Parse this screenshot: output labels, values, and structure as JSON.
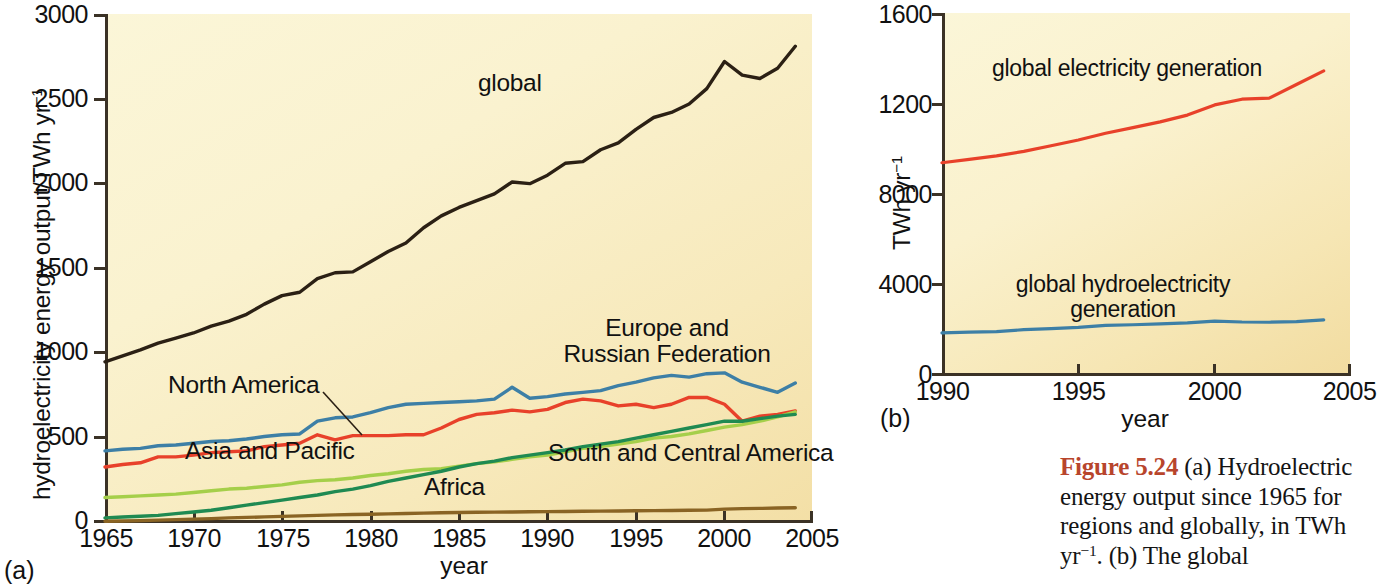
{
  "figure": {
    "number": "5.24",
    "number_prefix": "Figure",
    "caption_text": " (a)  Hydroelectric energy output since 1965 for regions and globally, in TWh yr",
    "caption_sup": "−1",
    "caption_tail": ". (b)  The global",
    "accent_color": "#b8452c"
  },
  "panel_a": {
    "tag": "(a)",
    "ylabel_main": "hydroelectricity energy output/TWh yr",
    "ylabel_sup": "−1",
    "xlabel": "year",
    "yticks": [
      "0",
      "500",
      "1000",
      "1500",
      "2000",
      "2500",
      "3000"
    ],
    "xticks": [
      "1965",
      "1970",
      "1975",
      "1980",
      "1985",
      "1990",
      "1995",
      "2000",
      "2005"
    ],
    "labels": {
      "global": "global",
      "north_america": "North America",
      "europe_russia_line1": "Europe and",
      "europe_russia_line2": "Russian Federation",
      "asia_pacific": "Asia and Pacific",
      "south_central_america": "South and Central America",
      "africa": "Africa"
    },
    "colors": {
      "global": "#2b2014",
      "europe_russia": "#3d7fa6",
      "north_america": "#e8412a",
      "asia_pacific": "#a5cf4a",
      "south_central_america": "#1f8a52",
      "africa": "#8a6424",
      "plot_background": "#f9efc7",
      "axis": "#3b3226"
    }
  },
  "panel_b": {
    "tag": "(b)",
    "ylabel_main": "TWh yr",
    "ylabel_sup": "−1",
    "xlabel": "year",
    "yticks": [
      "0",
      "4000",
      "8000",
      "1200",
      "1600"
    ],
    "xticks": [
      "1990",
      "1995",
      "2000",
      "2005"
    ],
    "labels": {
      "electricity": "global electricity generation",
      "hydro_line1": "global hydroelectricity",
      "hydro_line2": "generation"
    },
    "colors": {
      "electricity": "#e8412a",
      "hydro": "#3d7fa6",
      "plot_background": "#f9efc7",
      "axis": "#3b3226"
    }
  },
  "chart_data": [
    {
      "type": "line",
      "id": "panel_a",
      "title": "Hydroelectric energy output since 1965 for regions and globally",
      "xlabel": "year",
      "ylabel": "hydroelectricity energy output/TWh yr⁻¹",
      "xlim": [
        1965,
        2005
      ],
      "ylim": [
        0,
        3000
      ],
      "xticks": [
        1965,
        1970,
        1975,
        1980,
        1985,
        1990,
        1995,
        2000,
        2005
      ],
      "yticks": [
        0,
        500,
        1000,
        1500,
        2000,
        2500,
        3000
      ],
      "grid": false,
      "legend": "inline-annotations",
      "x": [
        1965,
        1966,
        1967,
        1968,
        1969,
        1970,
        1971,
        1972,
        1973,
        1974,
        1975,
        1976,
        1977,
        1978,
        1979,
        1980,
        1981,
        1982,
        1983,
        1984,
        1985,
        1986,
        1987,
        1988,
        1989,
        1990,
        1991,
        1992,
        1993,
        1994,
        1995,
        1996,
        1997,
        1998,
        1999,
        2000,
        2001,
        2002,
        2003,
        2004
      ],
      "series": [
        {
          "name": "global",
          "color": "#2b2014",
          "values": [
            950,
            985,
            1020,
            1060,
            1090,
            1120,
            1160,
            1190,
            1230,
            1290,
            1340,
            1360,
            1440,
            1475,
            1480,
            1540,
            1600,
            1650,
            1740,
            1810,
            1860,
            1900,
            1940,
            2010,
            2000,
            2050,
            2120,
            2130,
            2200,
            2240,
            2320,
            2390,
            2420,
            2470,
            2560,
            2720,
            2640,
            2620,
            2680,
            2810
          ]
        },
        {
          "name": "Europe and Russian Federation",
          "color": "#3d7fa6",
          "values": [
            425,
            435,
            440,
            455,
            460,
            470,
            480,
            485,
            495,
            510,
            520,
            525,
            600,
            620,
            625,
            650,
            680,
            700,
            705,
            710,
            715,
            720,
            730,
            800,
            735,
            745,
            760,
            770,
            780,
            810,
            830,
            855,
            870,
            860,
            880,
            885,
            830,
            800,
            770,
            825
          ]
        },
        {
          "name": "North America",
          "color": "#e8412a",
          "values": [
            330,
            345,
            355,
            390,
            390,
            400,
            415,
            420,
            425,
            450,
            460,
            470,
            520,
            490,
            515,
            515,
            515,
            520,
            520,
            560,
            610,
            640,
            650,
            665,
            655,
            670,
            710,
            730,
            720,
            690,
            700,
            680,
            700,
            740,
            740,
            700,
            600,
            630,
            640,
            660
          ]
        },
        {
          "name": "Asia and Pacific",
          "color": "#a5cf4a",
          "values": [
            150,
            155,
            160,
            165,
            170,
            180,
            190,
            200,
            205,
            215,
            225,
            240,
            250,
            255,
            265,
            280,
            290,
            305,
            315,
            320,
            335,
            350,
            360,
            375,
            390,
            400,
            420,
            440,
            450,
            465,
            480,
            500,
            510,
            525,
            545,
            565,
            580,
            600,
            625,
            655
          ]
        },
        {
          "name": "South and Central America",
          "color": "#1f8a52",
          "values": [
            30,
            35,
            40,
            45,
            55,
            65,
            75,
            90,
            105,
            120,
            135,
            150,
            165,
            185,
            200,
            220,
            245,
            265,
            285,
            305,
            330,
            350,
            365,
            385,
            400,
            415,
            430,
            450,
            465,
            480,
            500,
            520,
            540,
            560,
            580,
            600,
            600,
            615,
            630,
            640
          ]
        },
        {
          "name": "Africa",
          "color": "#8a6424",
          "values": [
            10,
            12,
            14,
            17,
            20,
            23,
            26,
            30,
            33,
            36,
            39,
            42,
            45,
            48,
            50,
            52,
            54,
            56,
            58,
            60,
            62,
            63,
            64,
            65,
            66,
            67,
            68,
            69,
            70,
            71,
            72,
            73,
            74,
            75,
            76,
            82,
            85,
            86,
            88,
            90
          ]
        }
      ]
    },
    {
      "type": "line",
      "id": "panel_b",
      "title": "Global electricity generation and global hydroelectricity generation",
      "xlabel": "year",
      "ylabel": "TWh yr⁻¹",
      "xlim": [
        1990,
        2005
      ],
      "ylim": [
        0,
        16000
      ],
      "xticks": [
        1990,
        1995,
        2000,
        2005
      ],
      "yticks": [
        0,
        4000,
        8000,
        12000,
        16000
      ],
      "ytick_labels": [
        "0",
        "4000",
        "8000",
        "1200",
        "1600"
      ],
      "grid": false,
      "legend": "inline-annotations",
      "x": [
        1990,
        1991,
        1992,
        1993,
        1994,
        1995,
        1996,
        1997,
        1998,
        1999,
        2000,
        2001,
        2002,
        2003,
        2004
      ],
      "series": [
        {
          "name": "global electricity generation",
          "color": "#e8412a",
          "values": [
            9400,
            9550,
            9700,
            9900,
            10150,
            10400,
            10700,
            10950,
            11200,
            11500,
            11950,
            12200,
            12250,
            12850,
            13450
          ]
        },
        {
          "name": "global hydroelectricity generation",
          "color": "#3d7fa6",
          "values": [
            1900,
            1930,
            1960,
            2040,
            2090,
            2140,
            2230,
            2260,
            2300,
            2340,
            2420,
            2380,
            2370,
            2400,
            2470
          ]
        }
      ]
    }
  ]
}
